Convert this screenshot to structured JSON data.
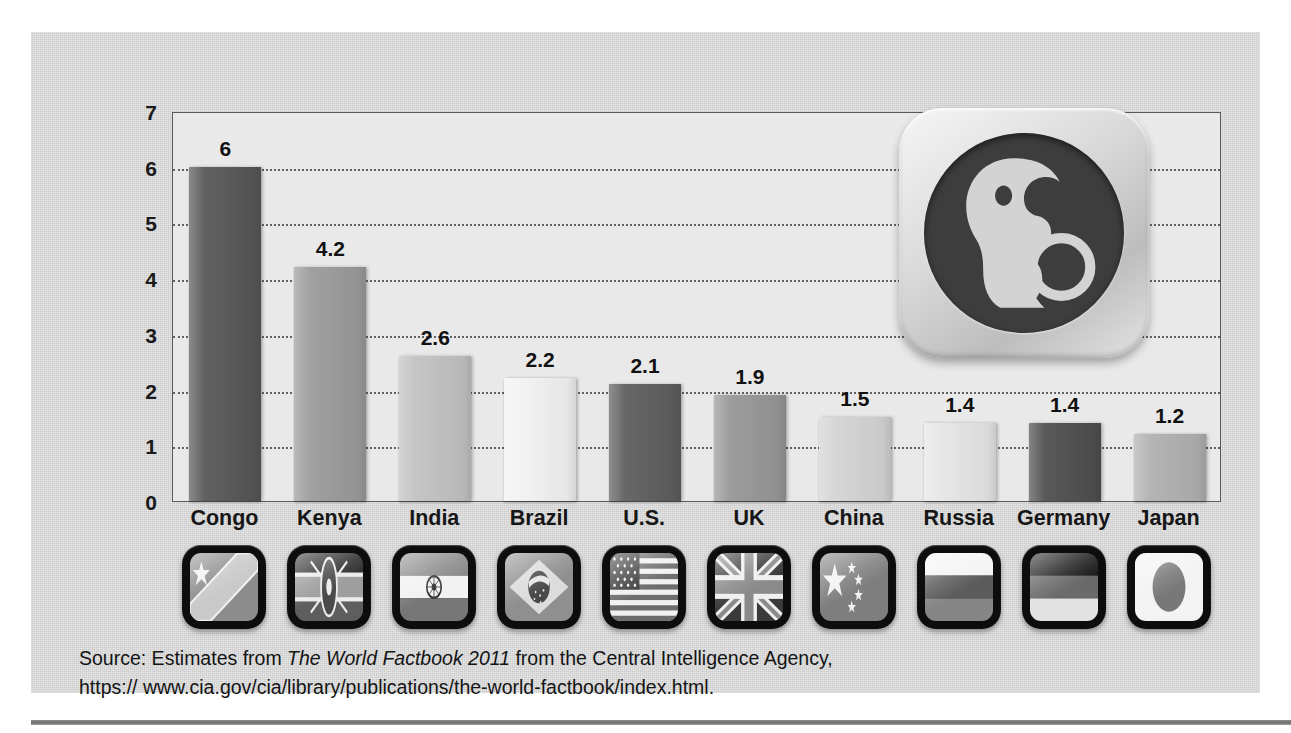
{
  "chart_data": {
    "type": "bar",
    "title": "",
    "xlabel": "",
    "ylabel": "",
    "ylim": [
      0,
      7
    ],
    "yticks": [
      "0",
      "1",
      "2",
      "3",
      "4",
      "5",
      "6",
      "7"
    ],
    "grid": true,
    "legend": "none",
    "categories": [
      "Congo",
      "Kenya",
      "India",
      "Brazil",
      "U.S.",
      "UK",
      "China",
      "Russia",
      "Germany",
      "Japan"
    ],
    "values": [
      6,
      4.2,
      2.6,
      2.2,
      2.1,
      1.9,
      1.5,
      1.4,
      1.4,
      1.2
    ],
    "value_labels": [
      "6",
      "4.2",
      "2.6",
      "2.2",
      "2.1",
      "1.9",
      "1.5",
      "1.4",
      "1.4",
      "1.2"
    ],
    "bar_colors": [
      "#575757",
      "#9b9b9b",
      "#c2c2c2",
      "#f2f2f2",
      "#5e5e5e",
      "#979797",
      "#d4d4d4",
      "#e6e6e6",
      "#4f4f4f",
      "#b0b0b0"
    ]
  },
  "flags": [
    {
      "country": "Congo",
      "icon": "flag-congo-icon"
    },
    {
      "country": "Kenya",
      "icon": "flag-kenya-icon"
    },
    {
      "country": "India",
      "icon": "flag-india-icon"
    },
    {
      "country": "Brazil",
      "icon": "flag-brazil-icon"
    },
    {
      "country": "U.S.",
      "icon": "flag-united-states-icon"
    },
    {
      "country": "UK",
      "icon": "flag-united-kingdom-icon"
    },
    {
      "country": "China",
      "icon": "flag-china-icon"
    },
    {
      "country": "Russia",
      "icon": "flag-russia-icon"
    },
    {
      "country": "Germany",
      "icon": "flag-germany-icon"
    },
    {
      "country": "Japan",
      "icon": "flag-japan-icon"
    }
  ],
  "logo": {
    "icon": "mother-and-child-icon"
  },
  "source": {
    "prefix": "Source: Estimates from ",
    "italic_title": "The World Factbook 2011",
    "suffix": " from the Central Intelligence Agency,",
    "url": "https:// www.cia.gov/cia/library/publications/the-world-factbook/index.html."
  },
  "colors": {
    "panel_background": "#d4d4d4",
    "plot_background": "#e9e9e9",
    "plot_border": "#5a5a5a",
    "gridline": "#4a4a4a",
    "text": "#141414",
    "logo_disc": "#3d3d3d",
    "logo_figure": "#d3d3d3",
    "icon_frame": "#0d0d0d"
  }
}
